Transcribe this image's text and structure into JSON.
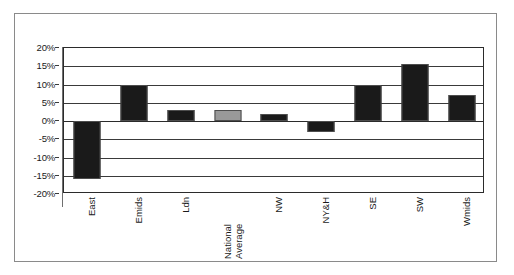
{
  "chart_data": {
    "type": "bar",
    "title": "",
    "subtitle": "",
    "xlabel": "",
    "ylabel": "",
    "categories": [
      "East",
      "Emids",
      "Ldn",
      "National Average",
      "NW",
      "NY&H",
      "SE",
      "SW",
      "Wmids"
    ],
    "values": [
      -16,
      10,
      3,
      3,
      2,
      -3,
      10,
      15.5,
      7
    ],
    "value_format": "percent",
    "ylim": [
      -20,
      20
    ],
    "ytick_values": [
      20,
      15,
      10,
      5,
      0,
      -5,
      -10,
      -15,
      -20
    ],
    "ytick_labels": [
      "20%",
      "15%",
      "10%",
      "5%",
      "0%",
      "-5%",
      "-10%",
      "-15%",
      "-20%"
    ],
    "grid": true,
    "grid_axis": "y",
    "legend": false,
    "legend_position": "none",
    "bar_colors": [
      "#1a1a1a",
      "#1a1a1a",
      "#1a1a1a",
      "#999999",
      "#1a1a1a",
      "#1a1a1a",
      "#1a1a1a",
      "#1a1a1a",
      "#1a1a1a"
    ],
    "highlight_category": "National Average",
    "highlight_color": "#999999",
    "default_bar_color": "#1a1a1a",
    "bar_border_color": "#4d4d4d",
    "plot_border_color": "#2b2b2b",
    "gridline_color": "#3a3a3a",
    "figure_border_color": "#8a8a8a",
    "background_color": "#ffffff"
  },
  "x_axis": {
    "labels": [
      {
        "lines": [
          "East"
        ]
      },
      {
        "lines": [
          "Emids"
        ]
      },
      {
        "lines": [
          "Ldn"
        ]
      },
      {
        "lines": [
          "National",
          "Average"
        ]
      },
      {
        "lines": [
          "NW"
        ]
      },
      {
        "lines": [
          "NY&H"
        ]
      },
      {
        "lines": [
          "SE"
        ]
      },
      {
        "lines": [
          "SW"
        ]
      },
      {
        "lines": [
          "Wmids"
        ]
      }
    ]
  }
}
